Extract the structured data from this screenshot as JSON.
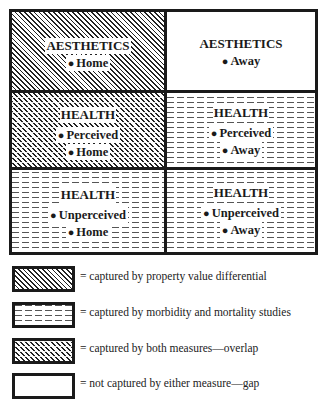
{
  "diagram": {
    "cells": [
      {
        "title": "AESTHETICS",
        "items": [
          "Home"
        ],
        "pattern": "property-value"
      },
      {
        "title": "AESTHETICS",
        "items": [
          "Away"
        ],
        "pattern": "gap"
      },
      {
        "title": "HEALTH",
        "items": [
          "Perceived",
          "Home"
        ],
        "pattern": "overlap"
      },
      {
        "title": "HEALTH",
        "items": [
          "Perceived",
          "Away"
        ],
        "pattern": "morbidity-mortality"
      },
      {
        "title": "HEALTH",
        "items": [
          "Unperceived",
          "Home"
        ],
        "pattern": "morbidity-mortality"
      },
      {
        "title": "HEALTH",
        "items": [
          "Unperceived",
          "Away"
        ],
        "pattern": "morbidity-mortality"
      }
    ],
    "bullet": "●"
  },
  "legend": [
    {
      "pattern": "property-value",
      "text": "= captured by property value differential"
    },
    {
      "pattern": "morbidity-mortality",
      "text": "= captured by morbidity and mortality studies"
    },
    {
      "pattern": "overlap",
      "text": "= captured by both measures—overlap"
    },
    {
      "pattern": "gap",
      "text": "= not captured by either measure—gap"
    }
  ]
}
